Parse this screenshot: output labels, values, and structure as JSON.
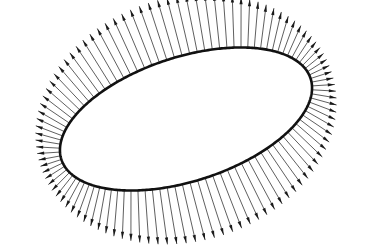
{
  "figure": {
    "background_color": "#ffffff",
    "ink_color": "#1a1a1a",
    "curve_color": "#111111",
    "canvas": {
      "width": 370,
      "height": 248
    }
  },
  "chart_data": {
    "type": "scatter",
    "subtitle": "",
    "xlabel": "",
    "ylabel": "",
    "xlim": [
      0,
      370
    ],
    "ylim": [
      248,
      0
    ],
    "grid": false,
    "legend": null,
    "annotations": [],
    "curve": {
      "name": "ellipse",
      "center_x": 186,
      "center_y": 119,
      "semi_major": 131,
      "semi_minor": 62,
      "rotation_deg": -18,
      "stroke_width": 2.6,
      "stroke_color": "#111111",
      "fill_color": "#ffffff",
      "x_extent": [
        72,
        300
      ],
      "y_extent": [
        58,
        180
      ]
    },
    "vectors": {
      "name": "outward normals",
      "count": 104,
      "direction": "outward",
      "parameter_uniform": true,
      "length_min": 22,
      "length_max": 60,
      "length_model": "proportional to local normal-speed of uniform-parameter sampling",
      "shaft_width": 0.7,
      "head_length": 7,
      "head_width": 3.2,
      "color": "#1a1a1a",
      "tip_x_extent": [
        10,
        358
      ],
      "tip_y_extent": [
        12,
        228
      ]
    }
  }
}
